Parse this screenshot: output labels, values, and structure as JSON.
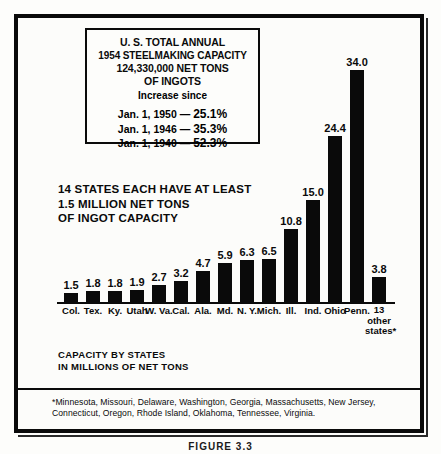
{
  "figure": {
    "caption": "FIGURE 3.3"
  },
  "title_box": {
    "line1": "U. S. TOTAL ANNUAL",
    "line2": "1954 STEELMAKING CAPACITY",
    "line3": "124,330,000 NET TONS",
    "line4": "OF INGOTS",
    "increase_label": "Increase since",
    "increases": [
      {
        "date": "Jan. 1, 1950",
        "dash": "—",
        "pct": "25.1%"
      },
      {
        "date": "Jan. 1, 1946",
        "dash": "—",
        "pct": "35.3%"
      },
      {
        "date": "Jan. 1, 1940",
        "dash": "—",
        "pct": "52.3%"
      }
    ]
  },
  "states_note": {
    "line1": "14 STATES EACH HAVE AT LEAST",
    "line2": "1.5 MILLION NET TONS",
    "line3": "OF INGOT CAPACITY"
  },
  "capacity_caption": {
    "line1": "CAPACITY BY STATES",
    "line2": "IN MILLIONS OF NET TONS"
  },
  "footnote": {
    "text": "*Minnesota, Missouri, Delaware, Washington, Georgia, Massachusetts, New Jersey, Connecticut, Oregon, Rhode Island, Oklahoma, Tennessee, Virginia."
  },
  "colors": {
    "bar": "#0a0a0a",
    "ink": "#0a0a0a",
    "paper": "#fdfdfb"
  },
  "chart_data": {
    "type": "bar",
    "title": "U. S. TOTAL ANNUAL 1954 STEELMAKING CAPACITY",
    "xlabel": "",
    "ylabel": "CAPACITY BY STATES IN MILLIONS OF NET TONS",
    "ylim": [
      0,
      34
    ],
    "grid": false,
    "legend": "none",
    "categories": [
      "Col.",
      "Tex.",
      "Ky.",
      "Utah",
      "W. Va.",
      "Cal.",
      "Ala.",
      "Md.",
      "N. Y.",
      "Mich.",
      "Ill.",
      "Ind.",
      "Ohio",
      "Penn.",
      "13 other states*"
    ],
    "values": [
      1.5,
      1.8,
      1.8,
      1.9,
      2.7,
      3.2,
      4.7,
      5.9,
      6.3,
      6.5,
      10.8,
      15.0,
      24.4,
      34.0,
      3.8
    ],
    "value_labels": [
      "1.5",
      "1.8",
      "1.8",
      "1.9",
      "2.7",
      "3.2",
      "4.7",
      "5.9",
      "6.3",
      "6.5",
      "10.8",
      "15.0",
      "24.4",
      "34.0",
      "3.8"
    ],
    "bars": [
      {
        "label": "Col.",
        "label_lines": [
          "Col."
        ],
        "value": 1.5,
        "value_label": "1.5"
      },
      {
        "label": "Tex.",
        "label_lines": [
          "Tex."
        ],
        "value": 1.8,
        "value_label": "1.8"
      },
      {
        "label": "Ky.",
        "label_lines": [
          "Ky."
        ],
        "value": 1.8,
        "value_label": "1.8"
      },
      {
        "label": "Utah",
        "label_lines": [
          "Utah"
        ],
        "value": 1.9,
        "value_label": "1.9"
      },
      {
        "label": "W. Va.",
        "label_lines": [
          "W. Va."
        ],
        "value": 2.7,
        "value_label": "2.7"
      },
      {
        "label": "Cal.",
        "label_lines": [
          "Cal."
        ],
        "value": 3.2,
        "value_label": "3.2"
      },
      {
        "label": "Ala.",
        "label_lines": [
          "Ala."
        ],
        "value": 4.7,
        "value_label": "4.7"
      },
      {
        "label": "Md.",
        "label_lines": [
          "Md."
        ],
        "value": 5.9,
        "value_label": "5.9"
      },
      {
        "label": "N. Y.",
        "label_lines": [
          "N. Y."
        ],
        "value": 6.3,
        "value_label": "6.3"
      },
      {
        "label": "Mich.",
        "label_lines": [
          "Mich."
        ],
        "value": 6.5,
        "value_label": "6.5"
      },
      {
        "label": "Ill.",
        "label_lines": [
          "Ill."
        ],
        "value": 10.8,
        "value_label": "10.8"
      },
      {
        "label": "Ind.",
        "label_lines": [
          "Ind."
        ],
        "value": 15.0,
        "value_label": "15.0"
      },
      {
        "label": "Ohio",
        "label_lines": [
          "Ohio"
        ],
        "value": 24.4,
        "value_label": "24.4"
      },
      {
        "label": "Penn.",
        "label_lines": [
          "Penn."
        ],
        "value": 34.0,
        "value_label": "34.0"
      },
      {
        "label": "13 other states*",
        "label_lines": [
          "13",
          "other",
          "states*"
        ],
        "value": 3.8,
        "value_label": "3.8"
      }
    ]
  }
}
